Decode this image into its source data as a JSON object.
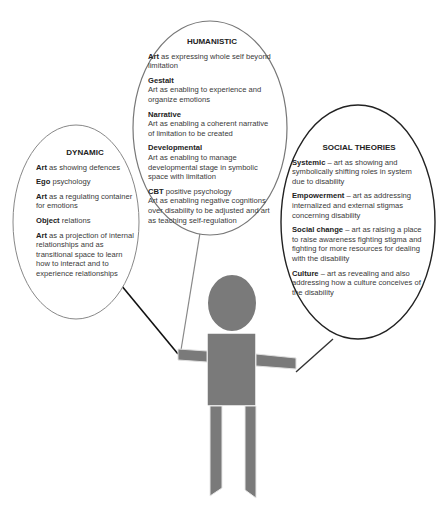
{
  "humanistic": {
    "title": "HUMANISTIC",
    "items": [
      {
        "head": "Art",
        "text": " as expressing whole self beyond limitation"
      },
      {
        "head": "Gestalt",
        "text": "Art as enabling to experience and organize emotions"
      },
      {
        "head": "Narrative",
        "text": "Art as enabling a coherent narrative of limitation to be created"
      },
      {
        "head": "Developmental",
        "text": "Art as enabling to manage developmental stage in symbolic space with limitation"
      },
      {
        "head": "CBT",
        "head_rest": " positive psychology",
        "text": "Art as enabling negative cognitions over disability to be adjusted and art as teaching self-regulation"
      }
    ]
  },
  "dynamic": {
    "title": "DYNAMIC",
    "items": [
      {
        "head": "Art",
        "text": " as showing defences"
      },
      {
        "head": "Ego",
        "text": " psychology"
      },
      {
        "head": "Art",
        "text": " as a regulating container for emotions"
      },
      {
        "head": "Object",
        "text": " relations"
      },
      {
        "head": "Art",
        "text": " as a projection of internal relationships and as transitional space to learn how to interact and to experience relationships"
      }
    ]
  },
  "social": {
    "title": "SOCIAL THEORIES",
    "items": [
      {
        "head": "Systemic",
        "text": " – art as showing and symbolically shifting roles in system due to disability"
      },
      {
        "head": "Empowerment",
        "text": " – art as addressing internalized and external stigmas concerning disability"
      },
      {
        "head": "Social change",
        "text": " – art as raising a place to raise awareness fighting stigma and fighting for more resources for dealing with the disability"
      },
      {
        "head": "Culture",
        "text": " – art as revealing and also addressing how a culture conceives of the disability"
      }
    ]
  },
  "figure": {
    "fill_color": "#7a7a7a",
    "outline_color": "#444444"
  }
}
